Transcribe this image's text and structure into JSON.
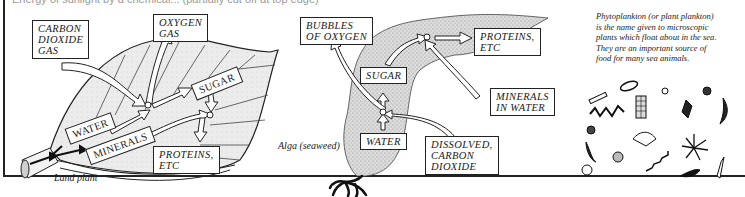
{
  "header": {
    "cropped_text": "Energy of sunlight by a chemical...  (partially cut off at top edge)"
  },
  "land_plant": {
    "caption": "Land plant",
    "labels": {
      "carbon_dioxide": [
        "CARBON",
        "DIOXIDE",
        "GAS"
      ],
      "oxygen": [
        "OXYGEN",
        "GAS"
      ],
      "sugar": "SUGAR",
      "water": "WATER",
      "minerals": "MINERALS",
      "proteins": [
        "PROTEINS,",
        "ETC"
      ]
    }
  },
  "alga": {
    "caption": "Alga (seaweed)",
    "labels": {
      "bubbles": [
        "BUBBLES",
        "OF OXYGEN"
      ],
      "sugar": "SUGAR",
      "proteins": [
        "PROTEINS,",
        "ETC"
      ],
      "minerals": [
        "MINERALS",
        "IN WATER"
      ],
      "water": "WATER",
      "dissolved_co2": [
        "DISSOLVED,",
        "CARBON",
        "DIOXIDE"
      ]
    }
  },
  "phytoplankton": {
    "description_lines": [
      "Phytoplankton (or plant plankton)",
      "is the name given to microscopic",
      "plants which float about in the sea.",
      "They are an important source of",
      "food for many sea animals."
    ]
  },
  "colors": {
    "ink": "#1a1a1a",
    "leaf_fill": "#e6e6e6",
    "alga_fill": "#d2d2d2",
    "arrow_fill": "#ffffff"
  }
}
